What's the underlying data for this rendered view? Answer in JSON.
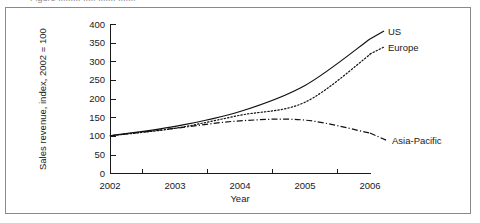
{
  "figure": {
    "cropped_caption_fragment": "Figure ......... ..... ....... .......",
    "frame_border_color": "#8a8a8a",
    "background_color": "#ffffff",
    "ink_color": "#111111"
  },
  "chart_data": {
    "type": "line",
    "title": "",
    "xlabel": "Year",
    "ylabel": "Sales revenue, index, 2002 = 100",
    "x": [
      2002,
      2003,
      2004,
      2005,
      2006
    ],
    "categories": [
      "2002",
      "2003",
      "2004",
      "2005",
      "2006"
    ],
    "xtick_labels": [
      "2002",
      "2003",
      "2004",
      "2005",
      "2006"
    ],
    "ytick_labels": [
      "0",
      "50",
      "100",
      "150",
      "200",
      "250",
      "300",
      "350",
      "400"
    ],
    "yticks": [
      0,
      50,
      100,
      150,
      200,
      250,
      300,
      350,
      400
    ],
    "ylim": [
      0,
      400
    ],
    "xlim": [
      2002,
      2006
    ],
    "grid": false,
    "legend_position": "inline-right-of-line-ends",
    "minor_xticks_between_labels": true,
    "series": [
      {
        "name": "US",
        "label": "US",
        "style": "solid",
        "values": [
          100,
          125,
          165,
          235,
          360
        ],
        "label_x": 2006,
        "label_y": 360
      },
      {
        "name": "Europe",
        "label": "Europe",
        "style": "dotted",
        "values": [
          100,
          120,
          155,
          190,
          318
        ],
        "label_x": 2006,
        "label_y": 318
      },
      {
        "name": "Asia-Pacific",
        "label": "Asia-Pacific",
        "style": "dash-dot",
        "values": [
          100,
          120,
          140,
          142,
          107
        ],
        "label_x": 2006,
        "label_y": 107
      }
    ]
  },
  "axis_geometry": {
    "plot_left_px": 110,
    "plot_right_px": 370,
    "plot_top_px": 24,
    "plot_bottom_px": 173
  }
}
